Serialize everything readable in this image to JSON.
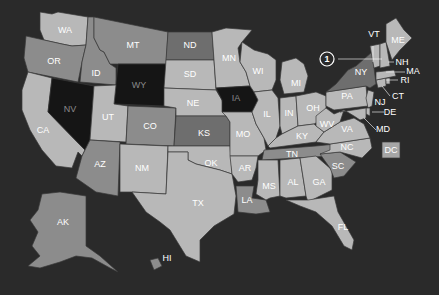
{
  "map": {
    "title": "United States",
    "background": "#2a2a2a",
    "shades": {
      "light": "#b8b8b8",
      "medium_light": "#a6a6a6",
      "medium": "#8c8c8c",
      "dark": "#6e6e6e",
      "black": "#151515"
    },
    "states": [
      {
        "code": "WA",
        "shade": "light"
      },
      {
        "code": "OR",
        "shade": "medium"
      },
      {
        "code": "CA",
        "shade": "light"
      },
      {
        "code": "ID",
        "shade": "medium"
      },
      {
        "code": "NV",
        "shade": "black"
      },
      {
        "code": "MT",
        "shade": "medium"
      },
      {
        "code": "WY",
        "shade": "black"
      },
      {
        "code": "UT",
        "shade": "light"
      },
      {
        "code": "AZ",
        "shade": "medium"
      },
      {
        "code": "CO",
        "shade": "medium"
      },
      {
        "code": "NM",
        "shade": "light"
      },
      {
        "code": "ND",
        "shade": "dark"
      },
      {
        "code": "SD",
        "shade": "light"
      },
      {
        "code": "NE",
        "shade": "light"
      },
      {
        "code": "KS",
        "shade": "dark"
      },
      {
        "code": "OK",
        "shade": "light"
      },
      {
        "code": "TX",
        "shade": "light"
      },
      {
        "code": "MN",
        "shade": "light"
      },
      {
        "code": "IA",
        "shade": "black"
      },
      {
        "code": "MO",
        "shade": "light"
      },
      {
        "code": "AR",
        "shade": "light"
      },
      {
        "code": "LA",
        "shade": "medium"
      },
      {
        "code": "WI",
        "shade": "light"
      },
      {
        "code": "IL",
        "shade": "light"
      },
      {
        "code": "MI",
        "shade": "light"
      },
      {
        "code": "IN",
        "shade": "light"
      },
      {
        "code": "OH",
        "shade": "light"
      },
      {
        "code": "KY",
        "shade": "light"
      },
      {
        "code": "TN",
        "shade": "medium"
      },
      {
        "code": "MS",
        "shade": "light"
      },
      {
        "code": "AL",
        "shade": "light"
      },
      {
        "code": "GA",
        "shade": "light"
      },
      {
        "code": "FL",
        "shade": "light"
      },
      {
        "code": "SC",
        "shade": "medium"
      },
      {
        "code": "NC",
        "shade": "light"
      },
      {
        "code": "VA",
        "shade": "light"
      },
      {
        "code": "WV",
        "shade": "light"
      },
      {
        "code": "PA",
        "shade": "light"
      },
      {
        "code": "NY",
        "shade": "dark"
      },
      {
        "code": "NJ",
        "shade": "light"
      },
      {
        "code": "DE",
        "shade": "light"
      },
      {
        "code": "MD",
        "shade": "light"
      },
      {
        "code": "CT",
        "shade": "light"
      },
      {
        "code": "RI",
        "shade": "light"
      },
      {
        "code": "MA",
        "shade": "light"
      },
      {
        "code": "VT",
        "shade": "light"
      },
      {
        "code": "NH",
        "shade": "light"
      },
      {
        "code": "ME",
        "shade": "light"
      },
      {
        "code": "DC",
        "shade": "medium_light"
      },
      {
        "code": "AK",
        "shade": "medium"
      },
      {
        "code": "HI",
        "shade": "medium"
      }
    ],
    "callout": {
      "number": "1",
      "target": "NH"
    }
  }
}
